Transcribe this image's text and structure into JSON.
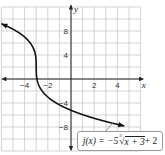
{
  "chart_data": {
    "type": "line",
    "title": "",
    "xlabel": "x",
    "ylabel": "y",
    "xlim": [
      -6,
      6.3
    ],
    "ylim": [
      -12,
      12.2
    ],
    "grid": true,
    "x_grid_step": 1,
    "y_grid_step": 2,
    "x_tick_labels": [
      "-4",
      "-2",
      "2",
      "4"
    ],
    "x_ticks": [
      -4,
      -2,
      2,
      4
    ],
    "y_tick_labels": [
      "8",
      "4",
      "-4",
      "-8"
    ],
    "y_ticks": [
      8,
      4,
      -4,
      -8
    ],
    "series": [
      {
        "name": "j(x) = -5∛(x + 3) + 2",
        "function": "-5*cbrt(x+3)+2",
        "x": [
          -6,
          -5,
          -4,
          -3.5,
          -3.1,
          -3,
          -2.9,
          -2.5,
          -2,
          -1,
          0,
          1,
          2,
          3,
          4,
          4.6
        ],
        "values": [
          9.21,
          8.3,
          7.0,
          5.97,
          4.32,
          2.0,
          -0.32,
          -1.97,
          -3.0,
          -5.94,
          -5.21,
          -5.94,
          -6.55,
          -7.09,
          -7.57,
          -7.83
        ],
        "arrows_both_ends": true,
        "color": "#111111"
      }
    ],
    "annotation": {
      "label_prefix": "j(x) = −5",
      "radical_index": "3",
      "radicand": "x + 3",
      "label_suffix": " + 2"
    }
  }
}
